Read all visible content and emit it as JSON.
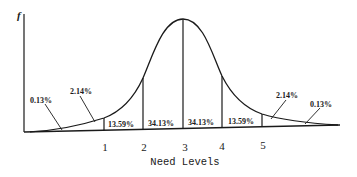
{
  "diagram": {
    "type": "normal-distribution-curve",
    "y_axis_label": "f",
    "x_axis_label": "Need Levels",
    "ticks": [
      {
        "label": "1",
        "x": 105
      },
      {
        "label": "2",
        "x": 144
      },
      {
        "label": "3",
        "x": 185
      },
      {
        "label": "4",
        "x": 222
      },
      {
        "label": "5",
        "x": 263
      }
    ],
    "regions": [
      {
        "label": "0.13%",
        "x": 55,
        "y": 101,
        "side": "left-tail"
      },
      {
        "label": "2.14%",
        "x": 96,
        "y": 92,
        "side": "left"
      },
      {
        "label": "13.59%",
        "x": 123,
        "y": 128,
        "side": "left-inner"
      },
      {
        "label": "34.13%",
        "x": 163,
        "y": 127,
        "side": "left-center"
      },
      {
        "label": "34.13%",
        "x": 202,
        "y": 126,
        "side": "right-center"
      },
      {
        "label": "13.59%",
        "x": 242,
        "y": 125,
        "side": "right-inner"
      },
      {
        "label": "2.14%",
        "x": 283,
        "y": 96,
        "side": "right"
      },
      {
        "label": "0.13%",
        "x": 324,
        "y": 105,
        "side": "right-tail"
      }
    ],
    "colors": {
      "ink": "#1a1a1a",
      "background": "#ffffff"
    }
  }
}
